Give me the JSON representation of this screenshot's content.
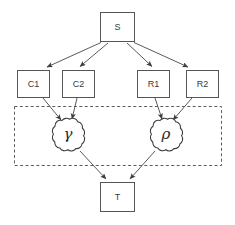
{
  "diagram": {
    "background_color": "#ffffff",
    "stroke_color": "#565656",
    "nodes": {
      "source": {
        "id": "S",
        "label": "S",
        "shape": "rectangle",
        "x": 100,
        "y": 12,
        "width": 35,
        "height": 30
      },
      "c1": {
        "id": "C1",
        "label": "C1",
        "shape": "rectangle",
        "x": 17,
        "y": 70,
        "width": 33,
        "height": 28
      },
      "c2": {
        "id": "C2",
        "label": "C2",
        "shape": "rectangle",
        "x": 62,
        "y": 70,
        "width": 33,
        "height": 28
      },
      "r1": {
        "id": "R1",
        "label": "R1",
        "shape": "rectangle",
        "x": 137,
        "y": 70,
        "width": 33,
        "height": 28
      },
      "r2": {
        "id": "R2",
        "label": "R2",
        "shape": "rectangle",
        "x": 186,
        "y": 70,
        "width": 33,
        "height": 28
      },
      "gamma": {
        "id": "gamma",
        "label": "γ",
        "shape": "cloud",
        "cx": 68,
        "cy": 136,
        "rx": 19,
        "ry": 17
      },
      "rho": {
        "id": "rho",
        "label": "ρ",
        "shape": "cloud",
        "cx": 166,
        "cy": 136,
        "rx": 19,
        "ry": 17
      },
      "target": {
        "id": "T",
        "label": "T",
        "shape": "rectangle",
        "x": 100,
        "y": 182,
        "width": 35,
        "height": 30
      }
    },
    "group_region": {
      "label": "",
      "style": "dashed",
      "x": 14,
      "y": 106,
      "width": 208,
      "height": 60
    },
    "edges": [
      {
        "from": "S",
        "to": "C1",
        "arrow": true
      },
      {
        "from": "S",
        "to": "C2",
        "arrow": true
      },
      {
        "from": "S",
        "to": "R1",
        "arrow": true
      },
      {
        "from": "S",
        "to": "R2",
        "arrow": true
      },
      {
        "from": "C1",
        "to": "gamma",
        "arrow": true
      },
      {
        "from": "C2",
        "to": "gamma",
        "arrow": true
      },
      {
        "from": "R1",
        "to": "rho",
        "arrow": true
      },
      {
        "from": "R2",
        "to": "rho",
        "arrow": true
      },
      {
        "from": "gamma",
        "to": "T",
        "arrow": true
      },
      {
        "from": "rho",
        "to": "T",
        "arrow": true
      }
    ]
  }
}
